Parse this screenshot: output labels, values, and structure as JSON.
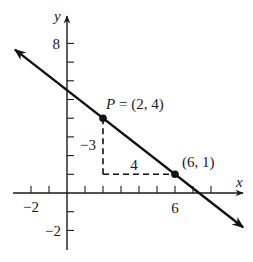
{
  "chart_data": {
    "type": "line",
    "title": "",
    "xlabel": "x",
    "ylabel": "y",
    "xlim": [
      -3,
      10
    ],
    "ylim": [
      -3,
      9
    ],
    "grid": false,
    "x_tick_values": [
      -2,
      -1,
      1,
      2,
      3,
      4,
      5,
      6,
      7,
      8
    ],
    "y_tick_values": [
      -2,
      -1,
      1,
      2,
      3,
      4,
      5,
      6,
      7,
      8
    ],
    "x_tick_labels": [
      {
        "value": -2,
        "label": "−2"
      },
      {
        "value": 6,
        "label": "6"
      }
    ],
    "y_tick_labels": [
      {
        "value": 8,
        "label": "8"
      },
      {
        "value": -2,
        "label": "−2"
      }
    ],
    "line": {
      "slope": -0.75,
      "through": [
        [
          2,
          4
        ],
        [
          6,
          1
        ]
      ],
      "x_range": [
        -2.89,
        9.78
      ],
      "arrows": "both"
    },
    "points": [
      {
        "name": "P",
        "x": 2,
        "y": 4,
        "label": "P = (2, 4)",
        "label_italic_part": "P",
        "label_rest": " = (2, 4)"
      },
      {
        "name": "",
        "x": 6,
        "y": 1,
        "label": "(6, 1)"
      }
    ],
    "slope_triangle": {
      "rise": -3,
      "run": 4,
      "rise_label": "−3",
      "run_label": "4",
      "corner": [
        2,
        1
      ],
      "style": "dashed"
    },
    "legend": null
  },
  "style": {
    "line_color": "#111111",
    "axis_color": "#1a1a1a",
    "background": "#ffffff"
  },
  "layout": {
    "origin_px": [
      67,
      193
    ],
    "unit_x_px": 18,
    "unit_y_px": 18.7
  }
}
